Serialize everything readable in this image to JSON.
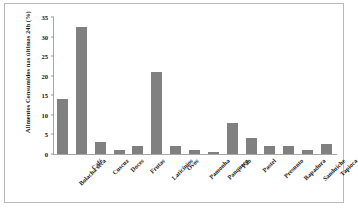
{
  "chart_data": {
    "type": "bar",
    "title": "",
    "subtitle": "",
    "xlabel": "",
    "ylabel": "Alimentos Consumidos nas últimas 24h (%)",
    "ylim": [
      0,
      35
    ],
    "ytick_step": 5,
    "yticks": [
      0,
      5,
      10,
      15,
      20,
      25,
      30,
      35
    ],
    "ytick_labels": [
      "0",
      "5",
      "10",
      "15",
      "20",
      "25",
      "30",
      "35"
    ],
    "grid": false,
    "legend": "none",
    "bar_color": "#808080",
    "axis_color": "#a8a8a8",
    "categories": [
      "Bolacha seca",
      "Café",
      "Cuscuz",
      "Doces",
      "Frutas",
      "Laticínios",
      "Ovos",
      "Pamonha",
      "Panqueca",
      "Pão",
      "Pastel",
      "Presunto",
      "Rapadura",
      "Sanduíche",
      "Tapioca"
    ],
    "values": [
      14,
      32.5,
      3,
      1,
      2,
      21,
      2,
      1,
      0.6,
      8,
      4,
      2,
      2,
      1,
      2.5
    ],
    "series": [
      {
        "name": "Alimentos Consumidos nas últimas 24h (%)",
        "values": [
          14,
          32.5,
          3,
          1,
          2,
          21,
          2,
          1,
          0.6,
          8,
          4,
          2,
          2,
          1,
          2.5
        ]
      }
    ]
  }
}
